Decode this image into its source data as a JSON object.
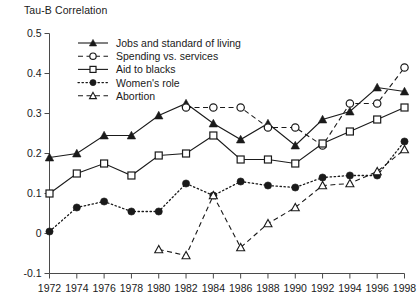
{
  "chart_data": {
    "type": "line",
    "title": "",
    "ylabel": "Tau-B Correlation",
    "xlabel": "",
    "ylim": [
      -0.1,
      0.5
    ],
    "ytick_labels": [
      "0.5",
      "0.4",
      "0.3",
      "0.2",
      "0.1",
      "0",
      "-0.1"
    ],
    "ytick_values": [
      0.5,
      0.4,
      0.3,
      0.2,
      0.1,
      0,
      -0.1
    ],
    "grid": false,
    "legend_position": "upper-left-inside",
    "categories": [
      1972,
      1974,
      1976,
      1978,
      1980,
      1982,
      1984,
      1986,
      1988,
      1990,
      1992,
      1994,
      1996,
      1998
    ],
    "xtick_labels": [
      "1972",
      "1974",
      "1976",
      "1978",
      "1980",
      "1982",
      "1984",
      "1986",
      "1988",
      "1990",
      "1992",
      "1994",
      "1996",
      "1998"
    ],
    "series": [
      {
        "name": "Jobs and standard of living",
        "marker": "filled-triangle",
        "line": "solid",
        "x": [
          1972,
          1974,
          1976,
          1978,
          1980,
          1982,
          1984,
          1986,
          1988,
          1990,
          1992,
          1994,
          1996,
          1998
        ],
        "values": [
          0.19,
          0.2,
          0.245,
          0.245,
          0.295,
          0.325,
          0.275,
          0.235,
          0.275,
          0.22,
          0.285,
          0.305,
          0.365,
          0.355
        ]
      },
      {
        "name": "Spending vs. services",
        "marker": "open-circle",
        "line": "dashed",
        "x": [
          1982,
          1984,
          1986,
          1988,
          1990,
          1992,
          1994,
          1996,
          1998
        ],
        "values": [
          0.315,
          0.315,
          0.315,
          0.265,
          0.265,
          0.22,
          0.325,
          0.325,
          0.415
        ]
      },
      {
        "name": "Aid to blacks",
        "marker": "open-square",
        "line": "solid",
        "x": [
          1972,
          1974,
          1976,
          1978,
          1980,
          1982,
          1984,
          1986,
          1988,
          1990,
          1992,
          1994,
          1996,
          1998
        ],
        "values": [
          0.1,
          0.15,
          0.175,
          0.145,
          0.195,
          0.2,
          0.245,
          0.185,
          0.185,
          0.175,
          0.225,
          0.255,
          0.285,
          0.315
        ]
      },
      {
        "name": "Women's role",
        "marker": "filled-circle",
        "line": "dotted",
        "x": [
          1972,
          1974,
          1976,
          1978,
          1980,
          1982,
          1984,
          1986,
          1988,
          1990,
          1992,
          1994,
          1996,
          1998
        ],
        "values": [
          0.005,
          0.065,
          0.08,
          0.055,
          0.055,
          0.125,
          0.095,
          0.13,
          0.12,
          0.115,
          0.14,
          0.145,
          0.145,
          0.23
        ]
      },
      {
        "name": "Abortion",
        "marker": "open-triangle",
        "line": "dashed",
        "x": [
          1980,
          1982,
          1984,
          1986,
          1988,
          1990,
          1992,
          1994,
          1996,
          1998
        ],
        "values": [
          -0.04,
          -0.055,
          0.095,
          -0.035,
          0.025,
          0.065,
          0.12,
          0.125,
          0.155,
          0.21
        ]
      }
    ]
  },
  "legend": {
    "items": [
      {
        "label": "Jobs and standard of living",
        "marker": "filled-triangle",
        "line": "solid"
      },
      {
        "label": "Spending vs. services",
        "marker": "open-circle",
        "line": "dashed"
      },
      {
        "label": "Aid to blacks",
        "marker": "open-square",
        "line": "solid"
      },
      {
        "label": "Women's role",
        "marker": "filled-circle",
        "line": "dotted"
      },
      {
        "label": "Abortion",
        "marker": "open-triangle",
        "line": "dashed"
      }
    ]
  },
  "colors": {
    "ink": "#1a1a1a",
    "axis": "#4a4a4a",
    "background": "#ffffff"
  }
}
